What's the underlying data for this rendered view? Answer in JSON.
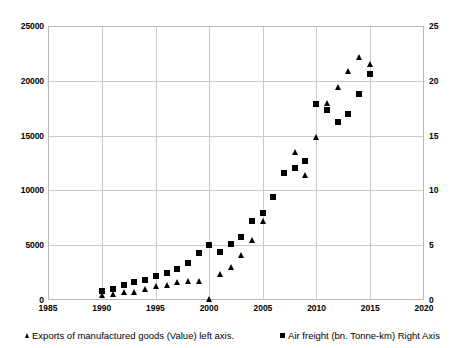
{
  "chart_data": {
    "type": "scatter",
    "title": "",
    "subtitle": "",
    "xlabel": "",
    "ylabel": "",
    "y2label": "",
    "grid": true,
    "legend_position": "bottom",
    "xlim": [
      1985,
      2020
    ],
    "xticks": [
      1985,
      1990,
      1995,
      2000,
      2005,
      2010,
      2015,
      2020
    ],
    "ylim": [
      0,
      25000
    ],
    "yticks": [
      0,
      5000,
      10000,
      15000,
      20000,
      25000
    ],
    "y2lim": [
      0,
      25
    ],
    "y2ticks": [
      0,
      5,
      10,
      15,
      20,
      25
    ],
    "x": [
      1990,
      1991,
      1992,
      1993,
      1994,
      1995,
      1996,
      1997,
      1998,
      1999,
      2000,
      2001,
      2002,
      2003,
      2004,
      2005,
      2006,
      2007,
      2008,
      2009,
      2010,
      2011,
      2012,
      2013,
      2014,
      2015
    ],
    "series": [
      {
        "name": "Exports of manufactured goods (Value) left axis.",
        "axis": "left",
        "marker": "triangle",
        "color": "#000000",
        "values": [
          400,
          500,
          600,
          650,
          900,
          1200,
          1250,
          1550,
          1650,
          1700,
          0,
          2300,
          2900,
          4000,
          5450,
          7150,
          9400,
          11600,
          13500,
          11400,
          14900,
          18000,
          19500,
          21000,
          22200,
          21600
        ]
      },
      {
        "name": "Air freight (bn. Tonne-km) Right Axis",
        "axis": "right",
        "marker": "square",
        "color": "#000000",
        "values": [
          0.75,
          0.9,
          1.25,
          1.55,
          1.75,
          2.1,
          2.4,
          2.8,
          3.35,
          4.2,
          5.0,
          4.35,
          5.1,
          5.7,
          7.15,
          7.9,
          9.4,
          11.6,
          12.0,
          12.65,
          17.95,
          17.4,
          16.3,
          17.0,
          18.8,
          20.7
        ]
      }
    ]
  },
  "axes": {
    "left_ticks": [
      "25000",
      "20000",
      "15000",
      "10000",
      "5000",
      "0"
    ],
    "right_ticks": [
      "25",
      "20",
      "15",
      "10",
      "5",
      "0"
    ],
    "x_ticks": [
      "1985",
      "1990",
      "1995",
      "2000",
      "2005",
      "2010",
      "2015",
      "2020"
    ]
  },
  "legend": {
    "entries": [
      {
        "label": "Exports of manufactured goods (Value) left axis.",
        "marker": "triangle-marker-icon"
      },
      {
        "label": "Air freight (bn. Tonne-km) Right Axis",
        "marker": "square-marker-icon"
      }
    ]
  }
}
